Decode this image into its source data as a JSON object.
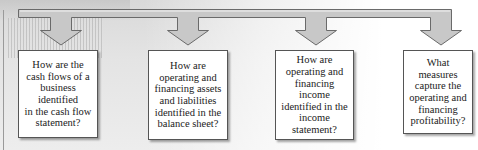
{
  "diagram": {
    "type": "flow-questions",
    "questions": [
      {
        "text": "How are the\ncash flows of a\nbusiness\nidentified\nin the cash flow\nstatement?"
      },
      {
        "text": "How are\noperating and\nfinancing assets\nand liabilities\nidentified in the\nbalance sheet?"
      },
      {
        "text": "How are\noperating and\nfinancing\nincome\nidentified in the\nincome\nstatement?"
      },
      {
        "text": "What\nmeasures\ncapture the\noperating and\nfinancing\nprofitability?"
      }
    ],
    "colors": {
      "arrow_fill": "#c8c8c8",
      "arrow_stroke": "#6a6a6a",
      "box_border": "#555555",
      "text": "#222222"
    }
  }
}
